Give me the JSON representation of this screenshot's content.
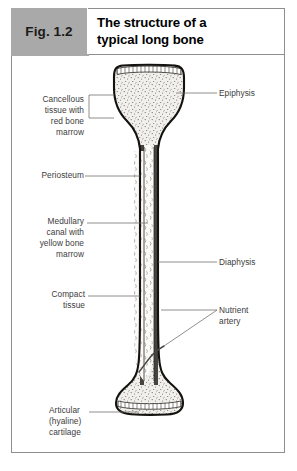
{
  "figure": {
    "tag": "Fig. 1.2",
    "title": "The structure of a\ntypical long bone",
    "accent_gray": "#a9a9a9",
    "border_gray": "#8e8e8e",
    "text_color": "#3c3c3c"
  },
  "labels": {
    "left": [
      {
        "name": "cancellous-tissue",
        "text": "Cancellous\ntissue with\nred bone\nmarrow",
        "align": "right"
      },
      {
        "name": "periosteum",
        "text": "Periosteum",
        "align": "right"
      },
      {
        "name": "medullary-canal",
        "text": "Medullary\ncanal with\nyellow bone\nmarrow",
        "align": "right"
      },
      {
        "name": "compact-tissue",
        "text": "Compact\ntissue",
        "align": "right"
      },
      {
        "name": "articular-cartilage",
        "text": "Articular\n(hyaline)\ncartilage",
        "align": "left"
      }
    ],
    "right": [
      {
        "name": "epiphysis",
        "text": "Epiphysis",
        "align": "left"
      },
      {
        "name": "diaphysis",
        "text": "Diaphysis",
        "align": "left"
      },
      {
        "name": "nutrient-artery",
        "text": "Nutrient\nartery",
        "align": "left"
      }
    ]
  },
  "diagram": {
    "type": "anatomical-illustration",
    "regions": [
      "proximal epiphysis",
      "diaphysis",
      "distal epiphysis",
      "medullary canal",
      "compact bone cortex",
      "articular cartilage"
    ]
  }
}
